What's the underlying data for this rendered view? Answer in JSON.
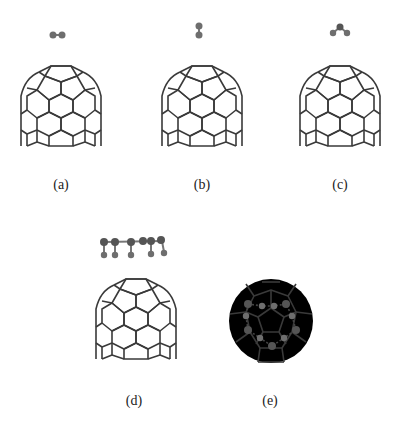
{
  "figure": {
    "panels": [
      {
        "id": "a",
        "label": "(a)",
        "adsorbate": "diatomic-horizontal",
        "structure": "open-cage-side-view"
      },
      {
        "id": "b",
        "label": "(b)",
        "adsorbate": "diatomic-vertical",
        "structure": "open-cage-side-view"
      },
      {
        "id": "c",
        "label": "(c)",
        "adsorbate": "triatomic-bent",
        "structure": "open-cage-side-view"
      },
      {
        "id": "d",
        "label": "(d)",
        "adsorbate": "chain-molecule",
        "structure": "open-cage-side-view"
      },
      {
        "id": "e",
        "label": "(e)",
        "adsorbate": "ring-of-atoms-dashed-bonds",
        "structure": "closed-cage-top-view"
      }
    ],
    "colors": {
      "background": "#ffffff",
      "cage_line": "#3a3a3a",
      "atom": "#6e6e6e",
      "label": "#222222"
    }
  }
}
